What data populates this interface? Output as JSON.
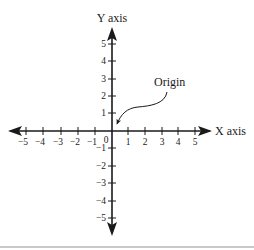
{
  "diagram": {
    "type": "cartesian-coordinate-plane",
    "x_axis_label": "X axis",
    "y_axis_label": "Y axis",
    "origin_label": "Origin",
    "origin_zero_label": "0",
    "x_ticks": [
      "−5",
      "−4",
      "−3",
      "−2",
      "−1",
      "1",
      "2",
      "3",
      "4",
      "5"
    ],
    "y_ticks_positive": [
      "5",
      "4",
      "3",
      "2",
      "1"
    ],
    "y_ticks_negative": [
      "−1",
      "−2",
      "−3",
      "−4",
      "−5"
    ],
    "x_range": [
      -5,
      5
    ],
    "y_range": [
      -5,
      5
    ],
    "colors": {
      "axis": "#1a1a1a",
      "text": "#1a1a1a",
      "divider": "#c8c8c8"
    }
  }
}
